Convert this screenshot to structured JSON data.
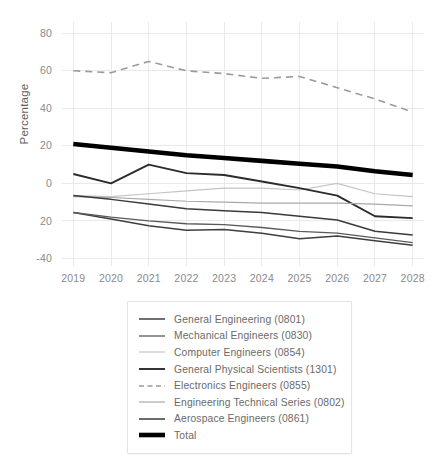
{
  "chart_data": {
    "type": "line",
    "title": "",
    "xlabel": "",
    "ylabel": "Percentage",
    "x": [
      2019,
      2020,
      2021,
      2022,
      2023,
      2024,
      2025,
      2026,
      2027,
      2028
    ],
    "xtick_labels": [
      "2019",
      "2020",
      "2021",
      "2022",
      "2023",
      "2024",
      "2025",
      "2026",
      "2027",
      "2028"
    ],
    "ytick_values": [
      80,
      60,
      40,
      20,
      0,
      -20,
      -40
    ],
    "ytick_labels": [
      "80",
      "60",
      "40",
      "20",
      "0",
      "20",
      "-40"
    ],
    "ylim": [
      -44,
      86
    ],
    "xlim": [
      2018.7,
      2028.3
    ],
    "grid": true,
    "legend_position": "below-center",
    "series": [
      {
        "name": "General Engineering (0801)",
        "code": "0801",
        "color": "#3f3f3f",
        "width": 1.5,
        "dash": "none",
        "values": [
          -15.5,
          -19.0,
          -22.5,
          -25.0,
          -24.5,
          -26.5,
          -29.5,
          -28.0,
          -30.5,
          -33.0
        ]
      },
      {
        "name": "Mechanical Engineers (0830)",
        "code": "0830",
        "color": "#5a5a5a",
        "width": 1.3,
        "dash": "none",
        "values": [
          -15.5,
          -18.0,
          -20.0,
          -21.5,
          -22.0,
          -23.5,
          -25.5,
          -26.5,
          -29.0,
          -31.5
        ]
      },
      {
        "name": "Computer Engineers (0854)",
        "code": "0854",
        "color": "#c4c4c4",
        "width": 1.2,
        "dash": "none",
        "values": [
          -6.5,
          -7.0,
          -5.5,
          -4.0,
          -2.5,
          -2.5,
          -3.5,
          0.0,
          -5.5,
          -7.0
        ]
      },
      {
        "name": "General Physical Scientists (1301)",
        "code": "1301",
        "color": "#2b2b2b",
        "width": 1.9,
        "dash": "none",
        "values": [
          5.0,
          0.0,
          10.0,
          5.5,
          4.5,
          1.0,
          -2.5,
          -6.5,
          -17.5,
          -18.5
        ]
      },
      {
        "name": "Electronics Engineers (0855)",
        "code": "0855",
        "color": "#9b9b9b",
        "width": 1.6,
        "dash": "7,5",
        "values": [
          60.0,
          59.0,
          65.0,
          60.0,
          58.5,
          56.0,
          57.0,
          51.0,
          45.0,
          38.0
        ]
      },
      {
        "name": "Engineering Technical Series (0802)",
        "code": "0802",
        "color": "#a9a9a9",
        "width": 1.2,
        "dash": "none",
        "values": [
          -7.0,
          -7.5,
          -8.5,
          -9.5,
          -10.0,
          -10.5,
          -10.5,
          -10.5,
          -11.0,
          -12.0
        ]
      },
      {
        "name": "Aerospace Engineers (0861)",
        "code": "0861",
        "color": "#3a3a3a",
        "width": 1.5,
        "dash": "none",
        "values": [
          -6.5,
          -8.5,
          -11.0,
          -13.5,
          -14.5,
          -15.5,
          -17.5,
          -19.5,
          -25.5,
          -27.5
        ]
      },
      {
        "name": "Total",
        "code": "total",
        "color": "#000000",
        "width": 4.6,
        "dash": "none",
        "values": [
          21.0,
          19.0,
          17.0,
          15.0,
          13.5,
          12.0,
          10.5,
          9.0,
          6.5,
          4.5
        ]
      }
    ]
  },
  "legend": {
    "items": [
      {
        "label": "General Engineering (0801)"
      },
      {
        "label": "Mechanical Engineers (0830)"
      },
      {
        "label": "Computer Engineers (0854)"
      },
      {
        "label": "General Physical Scientists (1301)"
      },
      {
        "label": "Electronics Engineers (0855)"
      },
      {
        "label": "Engineering Technical Series (0802)"
      },
      {
        "label": "Aerospace Engineers (0861)"
      },
      {
        "label": "Total"
      }
    ]
  },
  "axes": {
    "y_title": "Percentage"
  }
}
